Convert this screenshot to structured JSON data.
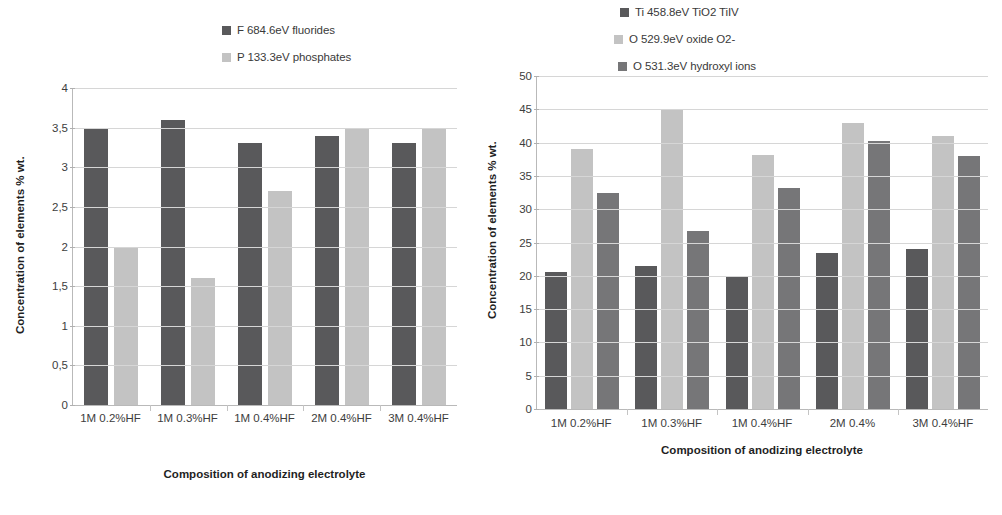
{
  "chart_data": [
    {
      "id": "left",
      "type": "bar",
      "title": "",
      "xlabel": "Composition of anodizing electrolyte",
      "ylabel": "Concentration of elements % wt.",
      "categories": [
        "1M 0.2%HF",
        "1M 0.3%HF",
        "1M 0.4%HF",
        "2M 0.4%HF",
        "3M 0.4%HF"
      ],
      "ylim": [
        0,
        4
      ],
      "ytick_labels": [
        "0",
        "0,5",
        "1",
        "1,5",
        "2",
        "2,5",
        "3",
        "3,5",
        "4"
      ],
      "ytick_values": [
        0,
        0.5,
        1,
        1.5,
        2,
        2.5,
        3,
        3.5,
        4
      ],
      "grid": true,
      "legend_position": "top",
      "series": [
        {
          "name": "F 684.6eV fluorides",
          "color": "#59595b",
          "values": [
            3.5,
            3.6,
            3.3,
            3.4,
            3.3
          ]
        },
        {
          "name": "P 133.3eV phosphates",
          "color": "#c3c3c3",
          "values": [
            2.0,
            1.6,
            2.7,
            3.5,
            3.5
          ]
        }
      ]
    },
    {
      "id": "right",
      "type": "bar",
      "title": "",
      "xlabel": "Composition of anodizing electrolyte",
      "ylabel": "Concentration of elements % wt.",
      "categories": [
        "1M 0.2%HF",
        "1M 0.3%HF",
        "1M 0.4%HF",
        "2M 0.4%",
        "3M 0.4%HF"
      ],
      "ylim": [
        0,
        50
      ],
      "ytick_labels": [
        "0",
        "5",
        "10",
        "15",
        "20",
        "25",
        "30",
        "35",
        "40",
        "45",
        "50"
      ],
      "ytick_values": [
        0,
        5,
        10,
        15,
        20,
        25,
        30,
        35,
        40,
        45,
        50
      ],
      "grid": true,
      "legend_position": "top",
      "series": [
        {
          "name": "Ti 458.8eV TiO2 TiIV",
          "color": "#59595b",
          "values": [
            20.5,
            21.4,
            19.8,
            23.5,
            24.0
          ]
        },
        {
          "name": "O 529.9eV oxide O2-",
          "color": "#c3c3c3",
          "values": [
            39.0,
            45.0,
            38.2,
            43.0,
            41.0
          ]
        },
        {
          "name": "O 531.3eV hydroxyl ions",
          "color": "#767678",
          "values": [
            32.5,
            26.8,
            33.2,
            40.3,
            38.0
          ]
        }
      ]
    }
  ],
  "colors": {
    "series_dark": "#59595b",
    "series_light": "#c3c3c3",
    "series_medium": "#767678",
    "grid": "#d6d6d6",
    "axis": "#b9b9b9",
    "text": "#3d3d3d"
  }
}
